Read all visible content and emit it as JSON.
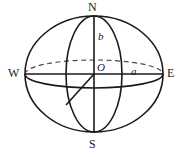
{
  "figure": {
    "name": "ellipsoid-sphere-diagram",
    "width": 186,
    "height": 157,
    "background_color": "#ffffff",
    "stroke_color": "#1a1a1a",
    "labels": {
      "north": "N",
      "south": "S",
      "west": "W",
      "east": "E",
      "origin": "O",
      "semi_axis_vertical": "b",
      "semi_axis_horizontal": "a"
    },
    "geometry": {
      "center": {
        "x": 94,
        "y": 74
      },
      "outline_ellipse": {
        "rx": 69,
        "ry": 58
      },
      "equator_ellipse": {
        "rx": 69,
        "ry": 14,
        "back_half_dashed": true
      },
      "meridian_ellipse": {
        "rx": 28,
        "ry": 58
      },
      "vertical_axis": {
        "x": 94,
        "y_top": 16,
        "y_bottom": 132
      },
      "horizontal_axis": {
        "y": 74,
        "x_left": 25,
        "x_right": 163
      },
      "radius_line": {
        "from_x": 94,
        "from_y": 74,
        "to_x": 66,
        "to_y": 105
      }
    }
  }
}
